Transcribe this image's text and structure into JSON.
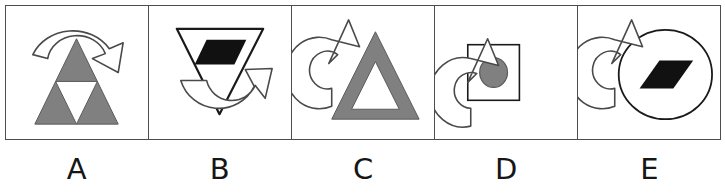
{
  "figure": {
    "type": "multiple-choice-answer-options",
    "panel_count": 5,
    "colors": {
      "gray_fill": "#808080",
      "gray_stroke": "#595959",
      "black_fill": "#111111",
      "outline": "#1a1a1a",
      "panel_border": "#4d4d4d",
      "background": "#ffffff"
    },
    "options": [
      {
        "label": "A",
        "shapes": [
          {
            "name": "subdivided-triangle",
            "description": "Large upward triangle, gray filled, with white inverted triangle cut from its center",
            "fill": "#808080",
            "orientation": "up"
          },
          {
            "name": "curved-arrow",
            "description": "Semicircular arc arrow over the top of the triangle, arrowhead at right pointing down-right",
            "fill": "#ffffff",
            "stroke": "#1a1a1a",
            "direction": "clockwise-over-top"
          }
        ]
      },
      {
        "label": "B",
        "shapes": [
          {
            "name": "inverted-triangle",
            "description": "Downward pointing triangle, white fill with black outline",
            "fill": "#ffffff",
            "orientation": "down"
          },
          {
            "name": "parallelogram",
            "description": "Black parallelogram inside upper part of the inverted triangle",
            "fill": "#111111"
          },
          {
            "name": "curved-arrow",
            "description": "U-shaped arrow under the triangle, arrowhead at upper right pointing up-right",
            "fill": "#ffffff",
            "stroke": "#1a1a1a",
            "direction": "counterclockwise-under-bottom"
          }
        ]
      },
      {
        "label": "C",
        "shapes": [
          {
            "name": "outlined-triangle",
            "description": "Upward triangle drawn as a thick gray band with white interior",
            "fill": "#808080",
            "orientation": "up"
          },
          {
            "name": "curved-arrow",
            "description": "C-shaped arrow at left of triangle, arrowhead at top pointing up-right",
            "fill": "#ffffff",
            "stroke": "#1a1a1a",
            "direction": "clockwise-left-side"
          }
        ]
      },
      {
        "label": "D",
        "shapes": [
          {
            "name": "square",
            "description": "White square with thin black outline",
            "fill": "#ffffff"
          },
          {
            "name": "circle",
            "description": "Gray filled circle centered inside the square",
            "fill": "#808080"
          },
          {
            "name": "curved-arrow",
            "description": "Reversed C-shaped arrow at right of the square, arrowhead at bottom pointing down-left",
            "fill": "#ffffff",
            "stroke": "#1a1a1a",
            "direction": "clockwise-right-side"
          }
        ]
      },
      {
        "label": "E",
        "shapes": [
          {
            "name": "circle",
            "description": "Large white circle with black outline",
            "fill": "#ffffff"
          },
          {
            "name": "parallelogram",
            "description": "Black parallelogram centered inside the circle",
            "fill": "#111111"
          },
          {
            "name": "curved-arrow",
            "description": "C-shaped arrow at left overlapping the circle, arrowhead at top pointing up-right",
            "fill": "#ffffff",
            "stroke": "#1a1a1a",
            "direction": "clockwise-left-side"
          }
        ]
      }
    ]
  }
}
